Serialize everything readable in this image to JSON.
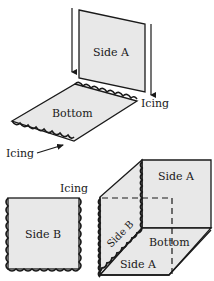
{
  "diagram": {
    "colors": {
      "panel_fill": "#e8e8e8",
      "stroke": "#1a1a1a",
      "background": "#ffffff"
    },
    "step1": {
      "side_a_label": "Side A",
      "bottom_label": "Bottom",
      "icing_label_right": "Icing",
      "icing_label_left": "Icing"
    },
    "step2": {
      "side_b_label": "Side B",
      "icing_label": "Icing"
    },
    "step3": {
      "back_side_a_label": "Side A",
      "side_b_label": "Side B",
      "bottom_label": "Bottom",
      "front_side_a_label": "Side A"
    }
  }
}
